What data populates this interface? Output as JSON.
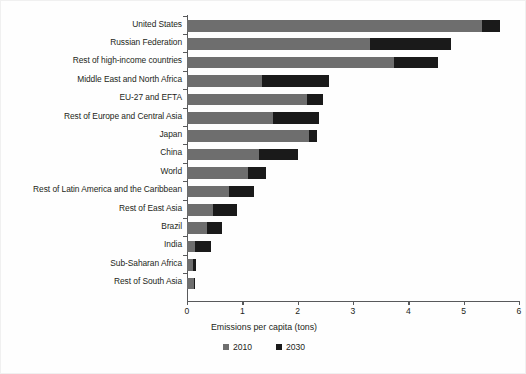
{
  "chart_data": {
    "type": "bar",
    "orientation": "horizontal",
    "stacked": true,
    "title": "",
    "xlabel": "Emissions per capita (tons)",
    "ylabel": "",
    "xlim": [
      0,
      6
    ],
    "xticks": [
      "0",
      "1",
      "2",
      "3",
      "4",
      "5",
      "6"
    ],
    "grid": false,
    "legend_position": "bottom",
    "legend": [
      "2010",
      "2030"
    ],
    "series": [
      {
        "name": "2010",
        "color": "#6e6e6e",
        "values": [
          5.33,
          3.31,
          3.74,
          1.36,
          2.17,
          1.55,
          2.2,
          1.3,
          1.1,
          0.76,
          0.47,
          0.36,
          0.15,
          0.11,
          0.13
        ]
      },
      {
        "name": "2030",
        "color": "#1a1a1a",
        "values": [
          0.33,
          1.46,
          0.8,
          1.21,
          0.29,
          0.84,
          0.15,
          0.7,
          0.33,
          0.45,
          0.43,
          0.27,
          0.28,
          0.05,
          0.02
        ]
      }
    ],
    "categories": [
      "United States",
      "Russian Federation",
      "Rest of high-income countries",
      "Middle East and North Africa",
      "EU-27 and EFTA",
      "Rest of Europe and Central Asia",
      "Japan",
      "China",
      "World",
      "Rest of Latin America and the Caribbean",
      "Rest of East Asia",
      "Brazil",
      "India",
      "Sub-Saharan Africa",
      "Rest of South Asia"
    ],
    "totals": [
      5.66,
      4.77,
      4.54,
      2.57,
      2.46,
      2.39,
      2.35,
      2.0,
      1.43,
      1.21,
      0.9,
      0.63,
      0.43,
      0.16,
      0.15
    ]
  },
  "axis": {
    "x_title": "Emissions per capita (tons)"
  },
  "colors": {
    "series_2010": "#6e6e6e",
    "series_2030": "#1a1a1a",
    "axis": "#58595b",
    "background": "#fefefe"
  }
}
